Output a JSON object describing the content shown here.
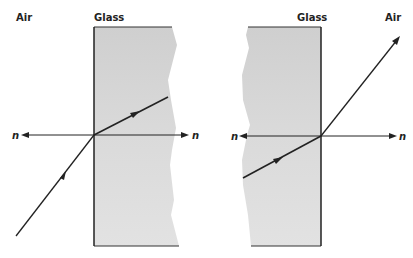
{
  "figure": {
    "type": "refraction-diagram",
    "left_panel": {
      "labels": {
        "medium_outside": "Air",
        "medium_block": "Glass",
        "normal_left": "n",
        "normal_right": "n"
      },
      "description": "Ray traveling from air into glass, bending toward the normal"
    },
    "right_panel": {
      "labels": {
        "medium_block": "Glass",
        "medium_outside": "Air",
        "normal_left": "n",
        "normal_right": "n"
      },
      "description": "Ray traveling from glass into air, bending away from the normal"
    },
    "colors": {
      "glass_fill": "#d4d4d4",
      "line": "#222222",
      "background": "#ffffff"
    }
  }
}
